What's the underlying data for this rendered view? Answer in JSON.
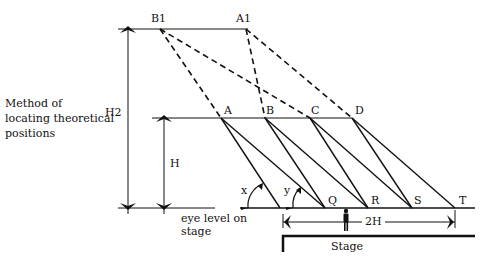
{
  "caption": {
    "line1": "Method of",
    "line2": "locating theoretical",
    "line3": "positions"
  },
  "points": {
    "B1": "B1",
    "A1": "A1",
    "A": "A",
    "B": "B",
    "C": "C",
    "D": "D",
    "Q": "Q",
    "R": "R",
    "S": "S",
    "T": "T"
  },
  "dimensions": {
    "h2": "H2",
    "h": "H",
    "two_h": "2H"
  },
  "angles": {
    "x": "x",
    "y": "y"
  },
  "ground": {
    "eye_level_line1": "eye level on",
    "eye_level_line2": "stage",
    "stage": "Stage"
  },
  "colors": {
    "ink": "#111111",
    "background": "#ffffff"
  }
}
